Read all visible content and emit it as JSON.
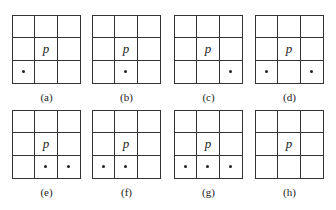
{
  "center_label": "p",
  "panels": [
    {
      "label": "(a)",
      "marked": [
        6
      ]
    },
    {
      "label": "(b)",
      "marked": [
        7
      ]
    },
    {
      "label": "(c)",
      "marked": [
        8
      ]
    },
    {
      "label": "(d)",
      "marked": [
        6,
        8
      ]
    },
    {
      "label": "(e)",
      "marked": [
        7,
        8
      ]
    },
    {
      "label": "(f)",
      "marked": [
        6,
        7
      ]
    },
    {
      "label": "(g)",
      "marked": [
        6,
        7,
        8
      ]
    },
    {
      "label": "(h)",
      "marked": []
    }
  ],
  "positions": [
    {
      "left": 12,
      "top": 15
    },
    {
      "left": 92,
      "top": 15
    },
    {
      "left": 174,
      "top": 15
    },
    {
      "left": 255,
      "top": 15
    },
    {
      "left": 12,
      "top": 110
    },
    {
      "left": 92,
      "top": 110
    },
    {
      "left": 174,
      "top": 110
    },
    {
      "left": 255,
      "top": 110
    }
  ]
}
